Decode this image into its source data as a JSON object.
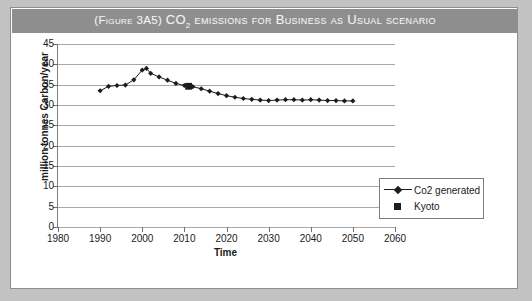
{
  "figure": {
    "title_prefix": "(Figure 3A5)",
    "title_main_pre": "CO",
    "title_main_sub": "2",
    "title_main_post": " emissions for Business as Usual scenario",
    "title_full": "(Figure 3A5) CO2 emissions for Business as Usual scenario",
    "banner_color": "#8e8e8e",
    "card_background": "#ffffff",
    "page_background": "#c2c2c2"
  },
  "chart_data": {
    "type": "line",
    "title": "(Figure 3A5) CO2 emissions for Business as Usual scenario",
    "xlabel": "Time",
    "ylabel": "million tonnes Carbon/year",
    "xlim": [
      1980,
      2060
    ],
    "ylim": [
      0,
      45
    ],
    "xticks": [
      1980,
      1990,
      2000,
      2010,
      2020,
      2030,
      2040,
      2050,
      2060
    ],
    "yticks": [
      0,
      5,
      10,
      15,
      20,
      25,
      30,
      35,
      40,
      45
    ],
    "grid": "horizontal",
    "legend_position": "right-inside",
    "series": [
      {
        "name": "Co2 generated",
        "marker": "diamond",
        "color": "#1c1c1c",
        "x": [
          1990,
          1992,
          1994,
          1996,
          1998,
          2000,
          2001,
          2002,
          2004,
          2006,
          2008,
          2010,
          2012,
          2014,
          2016,
          2018,
          2020,
          2022,
          2024,
          2026,
          2028,
          2030,
          2032,
          2034,
          2036,
          2038,
          2040,
          2042,
          2044,
          2046,
          2048,
          2050
        ],
        "values": [
          33.5,
          34.6,
          34.8,
          34.9,
          36.2,
          38.6,
          39.0,
          37.8,
          36.9,
          36.1,
          35.3,
          34.8,
          34.5,
          34.0,
          33.4,
          32.8,
          32.3,
          31.9,
          31.6,
          31.4,
          31.2,
          31.1,
          31.2,
          31.3,
          31.3,
          31.2,
          31.3,
          31.2,
          31.1,
          31.1,
          31.0,
          31.0
        ]
      },
      {
        "name": "Kyoto",
        "marker": "square",
        "color": "#1c1c1c",
        "x": [
          2011
        ],
        "values": [
          34.6
        ]
      }
    ]
  },
  "legend": {
    "entries": [
      {
        "label": "Co2 generated",
        "key": "line-diamond"
      },
      {
        "label": "Kyoto",
        "key": "square"
      }
    ]
  }
}
